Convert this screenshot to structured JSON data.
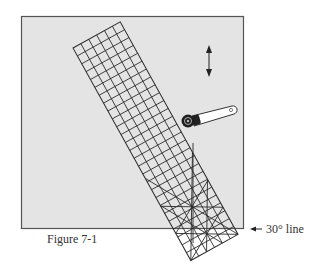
{
  "figure": {
    "caption": "Figure 7-1",
    "callout_label": "30° line",
    "colors": {
      "mat_fill": "#e4e4e4",
      "mat_border": "#555555",
      "grid_line": "#2a2a2a",
      "ruler_fill": "#e8e8e8",
      "cutter_handle": "#ffffff",
      "cutter_blade": "#1e1e1e"
    },
    "elements": {
      "cutting_mat": "square mat background",
      "ruler": "gridded rotated ruler (6 x 27 cells) with 30° angle lines",
      "rotary_cutter": "rotary cutter tool",
      "double_arrow": "vertical up/down movement arrow",
      "callout_arrow": "left-pointing arrow to 30° line"
    }
  }
}
